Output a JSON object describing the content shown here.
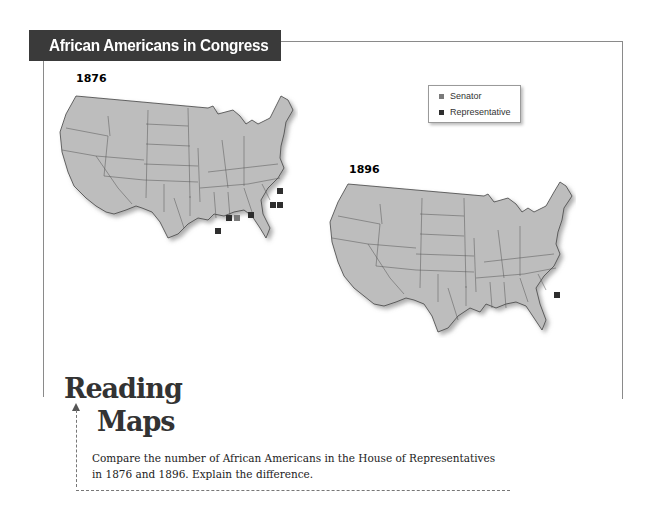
{
  "title": "African Americans in Congress",
  "legend": {
    "items": [
      {
        "label": "Senator",
        "color": "#7a7a7a"
      },
      {
        "label": "Representative",
        "color": "#2e2e2e"
      }
    ]
  },
  "maps": [
    {
      "year": "1876",
      "markers": [
        {
          "state": "North Carolina",
          "type": "Representative",
          "count": 1
        },
        {
          "state": "South Carolina",
          "type": "Representative",
          "count": 2
        },
        {
          "state": "Alabama",
          "type": "Representative",
          "count": 1
        },
        {
          "state": "Mississippi",
          "type": "Representative",
          "count": 1
        },
        {
          "state": "Mississippi",
          "type": "Senator",
          "count": 1
        },
        {
          "state": "Louisiana",
          "type": "Representative",
          "count": 1
        }
      ]
    },
    {
      "year": "1896",
      "markers": [
        {
          "state": "South Carolina",
          "type": "Representative",
          "count": 1
        }
      ]
    }
  ],
  "reading_maps": {
    "heading_line1": "Reading",
    "heading_line2": "Maps",
    "question_line1": "Compare the number of African Americans in the House of Representatives",
    "question_line2": "in 1876 and 1896. Explain the difference."
  },
  "colors": {
    "map_fill": "#bdbdbd",
    "state_border": "#4a4a4a",
    "title_bg": "#3a3a3a"
  }
}
